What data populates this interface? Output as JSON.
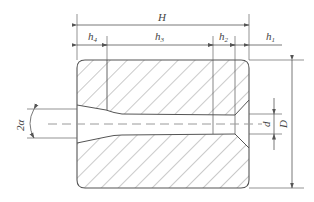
{
  "diagram": {
    "type": "die-cross-section",
    "labels": {
      "H": "H",
      "h1": "h",
      "h1_sub": "1",
      "h2": "h",
      "h2_sub": "2",
      "h3": "h",
      "h3_sub": "3",
      "h4": "h",
      "h4_sub": "4",
      "d": "d",
      "D": "D",
      "angle": "2α"
    },
    "colors": {
      "outline": "#555555",
      "hatch": "#8a8a8a",
      "dim": "#555555",
      "centerline": "#9a9a9a",
      "text": "#444444"
    }
  }
}
